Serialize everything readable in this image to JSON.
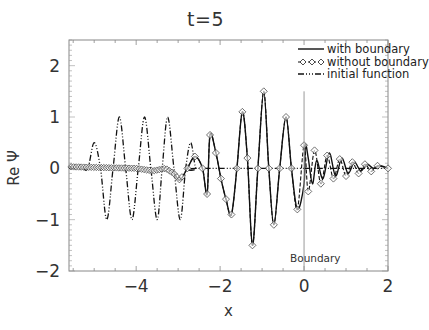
{
  "chart_data": {
    "type": "line",
    "title": "t=5",
    "xlabel": "x",
    "ylabel": "Re Ψ",
    "xlim": [
      -5.6,
      2.0
    ],
    "ylim": [
      -2.0,
      2.5
    ],
    "xticks": [
      -4,
      -2,
      0,
      2
    ],
    "xtick_labels": [
      "−4",
      "−2",
      "0",
      "2"
    ],
    "yticks": [
      -2,
      -1,
      0,
      1,
      2
    ],
    "ytick_labels": [
      "−2",
      "−1",
      "0",
      "1",
      "2"
    ],
    "grid": false,
    "legend_position": "upper right",
    "legend": [
      {
        "label": "with boundary",
        "style": "solid"
      },
      {
        "label": "without boundary",
        "style": "dashed-diamond"
      },
      {
        "label": "initial function",
        "style": "dash-dot"
      }
    ],
    "annotations": [
      {
        "text": "Boundary",
        "x": 0.0,
        "type": "vertical-line",
        "y_from": -2.0,
        "y_to": 1.5
      }
    ],
    "series": [
      {
        "name": "with boundary",
        "description": "Wave packet at t=5, confined by boundary at x=0; near-zero for x<-3.5, growing oscillations to peak ~1.5 near x=-1.0, small reflections for x>0",
        "x": [
          -5.6,
          -4.0,
          -3.6,
          -3.3,
          -3.1,
          -2.96,
          -2.78,
          -2.6,
          -2.42,
          -2.31,
          -2.24,
          -2.1,
          -1.98,
          -1.86,
          -1.73,
          -1.6,
          -1.47,
          -1.35,
          -1.23,
          -1.1,
          -0.96,
          -0.84,
          -0.72,
          -0.58,
          -0.43,
          -0.3,
          -0.16,
          0.0,
          0.03,
          0.1,
          0.2,
          0.3,
          0.45,
          0.6,
          0.75,
          0.9,
          1.05,
          1.2,
          1.35,
          1.5,
          1.65,
          1.8,
          2.0
        ],
        "values": [
          0.03,
          0.0,
          -0.05,
          0.0,
          -0.1,
          -0.23,
          0.0,
          0.23,
          0.0,
          -0.5,
          0.65,
          0.3,
          -0.2,
          -0.6,
          -0.9,
          0.0,
          1.1,
          0.2,
          -1.5,
          0.0,
          1.5,
          0.0,
          -1.1,
          0.0,
          1.0,
          0.0,
          -0.8,
          -0.3,
          0.45,
          0.2,
          -0.3,
          0.15,
          -0.2,
          0.3,
          -0.15,
          0.2,
          -0.1,
          0.12,
          -0.05,
          0.08,
          0.0,
          0.05,
          0.0
        ]
      },
      {
        "name": "without boundary",
        "description": "Free wave packet at t=5 (diamond markers), matches 'with boundary' for x<0, decaying oscillations beyond x=0",
        "x": [
          -5.6,
          -4.0,
          -3.6,
          -3.3,
          -3.1,
          -2.96,
          -2.78,
          -2.6,
          -2.42,
          -2.31,
          -2.24,
          -2.1,
          -1.98,
          -1.86,
          -1.73,
          -1.6,
          -1.47,
          -1.35,
          -1.23,
          -1.1,
          -0.96,
          -0.84,
          -0.72,
          -0.58,
          -0.43,
          -0.3,
          -0.16,
          0.0,
          0.1,
          0.25,
          0.4,
          0.55,
          0.7,
          0.85,
          1.0,
          1.15,
          1.3,
          1.45,
          1.6,
          1.75,
          2.0
        ],
        "values": [
          0.03,
          0.0,
          -0.05,
          0.0,
          -0.1,
          -0.23,
          0.0,
          0.23,
          0.0,
          -0.5,
          0.65,
          0.3,
          -0.2,
          -0.6,
          -0.9,
          0.0,
          1.1,
          0.2,
          -1.5,
          0.0,
          1.5,
          0.0,
          -1.1,
          0.0,
          1.0,
          0.0,
          -0.8,
          0.45,
          -0.45,
          0.35,
          -0.3,
          0.25,
          -0.2,
          0.18,
          -0.15,
          0.12,
          -0.1,
          0.08,
          -0.06,
          0.05,
          0.0
        ]
      },
      {
        "name": "initial function",
        "description": "Initial Gaussian-modulated wave packet centered ~x=-3.8, amplitude ~1, zero for x>-2.5",
        "x": [
          -5.6,
          -5.3,
          -5.15,
          -5.0,
          -4.85,
          -4.7,
          -4.55,
          -4.4,
          -4.25,
          -4.1,
          -3.95,
          -3.8,
          -3.65,
          -3.5,
          -3.38,
          -3.25,
          -3.1,
          -2.95,
          -2.82,
          -2.7,
          -2.58,
          -2.45,
          2.0
        ],
        "values": [
          0.0,
          0.0,
          0.0,
          0.5,
          0.0,
          -1.0,
          0.0,
          1.0,
          0.0,
          -1.0,
          0.0,
          1.0,
          0.0,
          -1.0,
          0.0,
          1.0,
          0.0,
          -1.0,
          0.0,
          0.5,
          0.0,
          0.0,
          0.0
        ]
      }
    ]
  }
}
